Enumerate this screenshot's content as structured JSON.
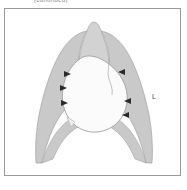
{
  "figure": {
    "caption_top": "(continued)",
    "side_label_left": "L",
    "title_alt": "Chest radiograph schematic"
  },
  "colors": {
    "lung_fill": "#c9c9c9",
    "mass_fill": "#fbfbfb",
    "outline": "#9a9a9a",
    "frame_border": "#9a9a9a",
    "background": "#ffffff",
    "arrow_marker": "#2b2b2b",
    "label_text": "#4a4a4a"
  },
  "annotations": {
    "arrowheads": [
      {
        "id": "arrow-left-1",
        "x": 67,
        "y": 72,
        "direction": "right"
      },
      {
        "id": "arrow-left-2",
        "x": 65,
        "y": 87,
        "direction": "right"
      },
      {
        "id": "arrow-left-3",
        "x": 67,
        "y": 101,
        "direction": "right"
      },
      {
        "id": "arrow-right-1",
        "x": 117,
        "y": 71,
        "direction": "left"
      },
      {
        "id": "arrow-right-2",
        "x": 123,
        "y": 100,
        "direction": "left"
      },
      {
        "id": "arrow-right-3",
        "x": 122,
        "y": 113,
        "direction": "left"
      }
    ],
    "arrowhead_count": 6
  },
  "structures": {
    "left_lung_field": "left-lung-shadow",
    "right_lung_field": "right-lung-shadow",
    "central_opacity": "mediastinal-mass",
    "apex": "apical-dome",
    "diaphragm": "diaphragm-contour"
  }
}
